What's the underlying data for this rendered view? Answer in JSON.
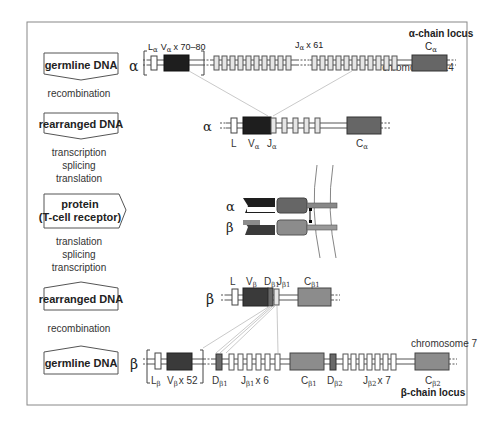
{
  "figure": {
    "frame": {
      "x": 27,
      "y": 22,
      "w": 440,
      "h": 383,
      "stroke": "#888888"
    },
    "colors": {
      "v_segment": "#1e1e1e",
      "c_alpha": "#666666",
      "c_beta": "#8c8c8c",
      "v_beta": "#3a3a3a",
      "d_beta": "#6a6a6a",
      "j_segment": "#e6e6e6",
      "l_segment": "#ffffff",
      "line": "#555555",
      "connector": "#bbbbbb",
      "membrane": "#777777"
    },
    "left_column": {
      "boxes": [
        {
          "id": "alpha-germline",
          "label": "germline DNA",
          "y": 53,
          "shape": "arrow-down"
        },
        {
          "id": "alpha-rearranged",
          "label": "rearranged DNA",
          "y": 113,
          "shape": "arrow-down"
        },
        {
          "id": "protein",
          "label_line1": "protein",
          "label_line2": "(T-cell receptor)",
          "y": 180,
          "shape": "arrow-right"
        },
        {
          "id": "beta-rearranged",
          "label": "rearranged DNA",
          "y": 282,
          "shape": "arrow-up"
        },
        {
          "id": "beta-germline",
          "label": "germline DNA",
          "y": 346,
          "shape": "arrow-up"
        }
      ],
      "steps": {
        "alpha_recombination": "recombination",
        "alpha_processing": [
          "transcription",
          "splicing",
          "translation"
        ],
        "beta_processing": [
          "translation",
          "splicing",
          "transcription"
        ],
        "beta_recombination": "recombination"
      }
    },
    "alpha_germline": {
      "chain_symbol": "α",
      "locus_title": "α-chain locus",
      "chromosome": "chromosome 14",
      "bracket_label_L": "L",
      "bracket_label_L_sub": "α",
      "bracket_label_V": "V",
      "bracket_label_V_sub": "α",
      "bracket_count": "x 70–80",
      "j_label": "J",
      "j_sub": "α",
      "j_count": "x 61",
      "c_label": "C",
      "c_sub": "α"
    },
    "alpha_rearranged": {
      "chain_symbol": "α",
      "labels": [
        {
          "text": "L",
          "sub": ""
        },
        {
          "text": "V",
          "sub": "α"
        },
        {
          "text": "J",
          "sub": "α"
        },
        {
          "text": "C",
          "sub": "α"
        }
      ]
    },
    "protein": {
      "alpha_symbol": "α",
      "beta_symbol": "β"
    },
    "beta_rearranged": {
      "chain_symbol": "β",
      "labels": [
        {
          "text": "L",
          "sub": ""
        },
        {
          "text": "V",
          "sub": "β"
        },
        {
          "text": "D",
          "sub": "β1"
        },
        {
          "text": "J",
          "sub": "β1"
        },
        {
          "text": "C",
          "sub": "β1"
        }
      ]
    },
    "beta_germline": {
      "chain_symbol": "β",
      "locus_title": "β-chain locus",
      "chromosome": "chromosome 7",
      "labels": [
        {
          "text": "L",
          "sub": "β",
          "count": ""
        },
        {
          "text": "V",
          "sub": "β",
          "count": "x 52"
        },
        {
          "text": "D",
          "sub": "β1",
          "count": ""
        },
        {
          "text": "J",
          "sub": "β1",
          "count": "x 6"
        },
        {
          "text": "C",
          "sub": "β1",
          "count": ""
        },
        {
          "text": "D",
          "sub": "β2",
          "count": ""
        },
        {
          "text": "J",
          "sub": "β2",
          "count": "x 7"
        },
        {
          "text": "C",
          "sub": "β2",
          "count": ""
        }
      ]
    }
  }
}
